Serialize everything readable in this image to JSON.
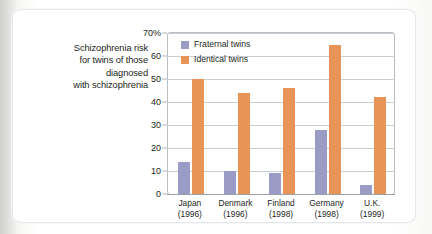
{
  "caption": {
    "lines": [
      "Schizophrenia risk",
      "for twins of those",
      "diagnosed",
      "with schizophrenia"
    ]
  },
  "legend": {
    "items": [
      {
        "label": "Fraternal twins",
        "color": "#9a9cc6"
      },
      {
        "label": "Identical twins",
        "color": "#e89457"
      }
    ]
  },
  "axis": {
    "yticks": [
      "0",
      "10",
      "20",
      "30",
      "40",
      "50",
      "60",
      "70%"
    ]
  },
  "chart_data": {
    "type": "bar",
    "title": "Schizophrenia risk for twins of those diagnosed with schizophrenia",
    "xlabel": "",
    "ylabel": "",
    "ylim": [
      0,
      70
    ],
    "yticks": [
      0,
      10,
      20,
      30,
      40,
      50,
      60,
      70
    ],
    "ytick_labels": [
      "0",
      "10",
      "20",
      "30",
      "40",
      "50",
      "60",
      "70%"
    ],
    "grid": true,
    "legend_position": "top-left inside plot",
    "categories": [
      "Japan",
      "Denmark",
      "Finland",
      "Germany",
      "U.K."
    ],
    "category_years": [
      "(1996)",
      "(1996)",
      "(1998)",
      "(1998)",
      "(1999)"
    ],
    "category_labels": [
      {
        "name": "Japan",
        "year": "(1996)"
      },
      {
        "name": "Denmark",
        "year": "(1996)"
      },
      {
        "name": "Finland",
        "year": "(1998)"
      },
      {
        "name": "Germany",
        "year": "(1998)"
      },
      {
        "name": "U.K.",
        "year": "(1999)"
      }
    ],
    "series": [
      {
        "name": "Fraternal twins",
        "color": "#9a9cc6",
        "values": [
          14,
          10,
          9,
          28,
          4
        ]
      },
      {
        "name": "Identical twins",
        "color": "#e89457",
        "values": [
          50,
          44,
          46,
          65,
          42
        ]
      }
    ]
  },
  "colors": {
    "fraternal": "#9a9cc6",
    "identical": "#e89457",
    "grid": "#c8cdd2",
    "frame": "#b9bfc4",
    "text": "#231f20",
    "panel": "#ffffff"
  }
}
